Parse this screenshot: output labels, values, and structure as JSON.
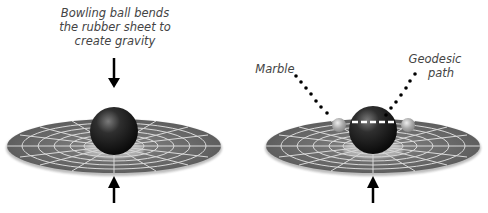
{
  "diagram": {
    "panels": [
      {
        "id": "left",
        "caption_lines": [
          "Bowling ball bends",
          "the rubber sheet to",
          "create gravity"
        ],
        "objects": [
          "rubber-sheet",
          "bowling-ball",
          "arrow-down",
          "arrow-up"
        ]
      },
      {
        "id": "right",
        "labels": {
          "marble": "Marble",
          "geodesic_line1": "Geodesic",
          "geodesic_line2": "path"
        },
        "objects": [
          "rubber-sheet",
          "bowling-ball",
          "marble-left",
          "marble-right",
          "geodesic-dashed-path",
          "dotted-leaders",
          "arrow-up"
        ]
      }
    ],
    "colors": {
      "sheet": "#6b6b6b",
      "grid": "#e8e8e8",
      "ball": "#1a1a1a",
      "text": "#444444",
      "arrow": "#000000"
    }
  }
}
